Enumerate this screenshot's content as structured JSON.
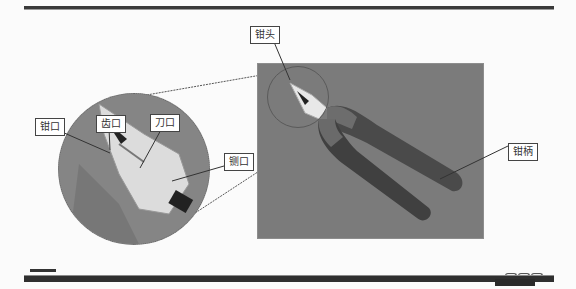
{
  "slide": {
    "title": "",
    "labels": {
      "head": "钳头",
      "jaw": "钳口",
      "teeth": "齿口",
      "blade": "刀口",
      "side_cutter": "铡口",
      "handle": "钳柄"
    },
    "image_description": "Combination pliers with dark two-tone grips on gray background, with magnified inset of the pliers head"
  }
}
